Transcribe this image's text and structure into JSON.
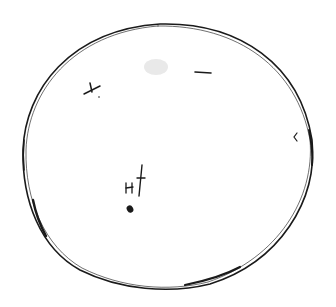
{
  "sketch": {
    "kind": "hand-drawn disk sketch",
    "stroke_color": "#1a1a1a",
    "background": "#ffffff",
    "smudge_color": "#e6e6e6",
    "disk": {
      "cx": 168,
      "cy": 157,
      "rx": 146,
      "ry": 134
    },
    "marks": [
      {
        "name": "upper-left-mark",
        "x": 92,
        "y": 90
      },
      {
        "name": "upper-right-dash",
        "x": 203,
        "y": 72
      },
      {
        "name": "right-edge-tick",
        "x": 295,
        "y": 136
      },
      {
        "name": "center-group-mark",
        "x": 135,
        "y": 185
      },
      {
        "name": "center-dot",
        "x": 130,
        "y": 209
      }
    ]
  }
}
